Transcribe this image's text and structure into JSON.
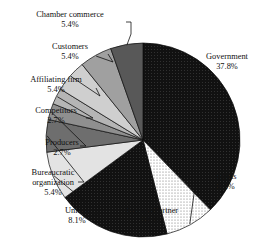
{
  "chart_data": {
    "type": "pie",
    "title": "",
    "categories": [
      "Government",
      "Banks",
      "Foreign Partner",
      "Unions",
      "Bureaucratic organization",
      "Producers",
      "Competitors",
      "Affiliating firm",
      "Customers",
      "Chamber commerce"
    ],
    "values": [
      37.8,
      8.2,
      18.9,
      8.1,
      5.4,
      2.7,
      2.7,
      5.4,
      5.4,
      5.4
    ],
    "value_unit": "%",
    "start_angle_deg": 0,
    "direction": "clockwise",
    "legend": "none",
    "labels_outside": true,
    "leader_lines": true,
    "slices": [
      {
        "label": "Government",
        "value": "37.8%",
        "color": "#121212",
        "pattern": "solid-dark"
      },
      {
        "label": "Banks",
        "value": "8.2%",
        "color": "#f2f2f2",
        "pattern": "fine-dots"
      },
      {
        "label": "Foreign Partner",
        "value": "18.9%",
        "color": "#262626",
        "pattern": "solid-dark"
      },
      {
        "label": "Unions",
        "value": "8.1%",
        "color": "#e3e3e3",
        "pattern": "light"
      },
      {
        "label": "Bureaucratic organization",
        "value": "5.4%",
        "color": "#6e6e6e",
        "pattern": "medium-gray"
      },
      {
        "label": "Producers",
        "value": "2.7%",
        "color": "#8f8f8f",
        "pattern": "gray"
      },
      {
        "label": "Competitors",
        "value": "2.7%",
        "color": "#b5b5b5",
        "pattern": "light-gray"
      },
      {
        "label": "Affiliating firm",
        "value": "5.4%",
        "color": "#cfcfcf",
        "pattern": "pale-gray"
      },
      {
        "label": "Customers",
        "value": "5.4%",
        "color": "#a0a0a0",
        "pattern": "gray"
      },
      {
        "label": "Chamber commerce",
        "value": "5.4%",
        "color": "#585858",
        "pattern": "dark-gray"
      }
    ]
  },
  "labels": {
    "chamber_commerce": {
      "name": "Chamber commerce",
      "pct": "5.4%"
    },
    "customers": {
      "name": "Customers",
      "pct": "5.4%"
    },
    "affiliating_firm": {
      "name": "Affiliating firm",
      "pct": "5.4%"
    },
    "competitors": {
      "name": "Competitors",
      "pct": "2.7%"
    },
    "producers": {
      "name": "Producers",
      "pct": "2.7%"
    },
    "bureaucratic": {
      "name_line1": "Bureaucratic",
      "name_line2": "organization",
      "pct": "5.4%"
    },
    "unions": {
      "name": "Unions",
      "pct": "8.1%"
    },
    "foreign_partner": {
      "name": "Foreign Partner",
      "pct": "18.9%"
    },
    "banks": {
      "name": "Banks",
      "pct": "8.2%"
    },
    "government": {
      "name": "Government",
      "pct": "37.8%"
    }
  }
}
